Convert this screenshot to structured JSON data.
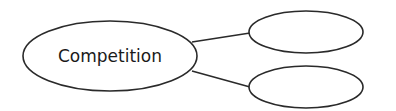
{
  "diagram": {
    "type": "mind-map",
    "nodes": [
      {
        "id": "center",
        "label": "Competition",
        "cx": 110,
        "cy": 56,
        "rx": 87,
        "ry": 35
      },
      {
        "id": "branch-1",
        "label": "",
        "cx": 306,
        "cy": 32,
        "rx": 57,
        "ry": 21
      },
      {
        "id": "branch-2",
        "label": "",
        "cx": 306,
        "cy": 87,
        "rx": 57,
        "ry": 21
      }
    ],
    "edges": [
      {
        "from": "center",
        "to": "branch-1"
      },
      {
        "from": "center",
        "to": "branch-2"
      }
    ]
  }
}
